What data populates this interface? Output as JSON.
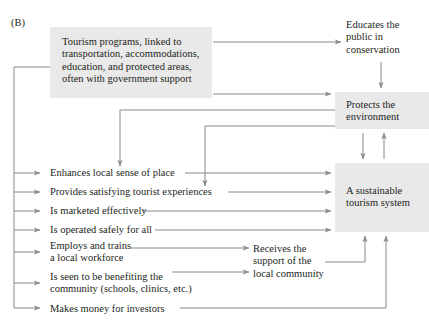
{
  "figure": {
    "panel_label": "(B)"
  },
  "nodes": {
    "programs": "Tourism programs, linked to transportation, accommodations, education, and protected areas, often with government support",
    "programs_lines": [
      "Tourism programs, linked to",
      "transportation, accommodations,",
      "education, and protected areas,",
      "often with government support"
    ],
    "educates": "Educates the public in conservation",
    "educates_lines": [
      "Educates the",
      "public in",
      "conservation"
    ],
    "protects": "Protects the environment",
    "protects_lines": [
      "Protects the",
      "environment"
    ],
    "sustainable": "A sustainable tourism system",
    "sustainable_lines": [
      "A sustainable",
      "tourism system"
    ],
    "receives": "Receives the support of the local community",
    "receives_lines": [
      "Receives the",
      "support of the",
      "local community"
    ]
  },
  "items": [
    {
      "id": "enhances",
      "text": "Enhances local sense of place"
    },
    {
      "id": "provides",
      "text": "Provides satisfying tourist experiences"
    },
    {
      "id": "marketed",
      "text": "Is marketed effectively"
    },
    {
      "id": "operated",
      "text": "Is operated safely for all"
    },
    {
      "id": "employs",
      "text": "Employs and trains a local workforce",
      "lines": [
        "Employs and trains",
        "a local workforce"
      ]
    },
    {
      "id": "benefiting",
      "text": "Is seen to be benefiting the community (schools, clinics, etc.)",
      "lines": [
        "Is seen to be benefiting the",
        "community (schools, clinics, etc.)"
      ]
    },
    {
      "id": "investors",
      "text": "Makes money for investors"
    }
  ],
  "colors": {
    "box_fill": "#e9e9e9",
    "text": "#231f20",
    "line": "#8a8a8a",
    "background": "#ffffff"
  }
}
